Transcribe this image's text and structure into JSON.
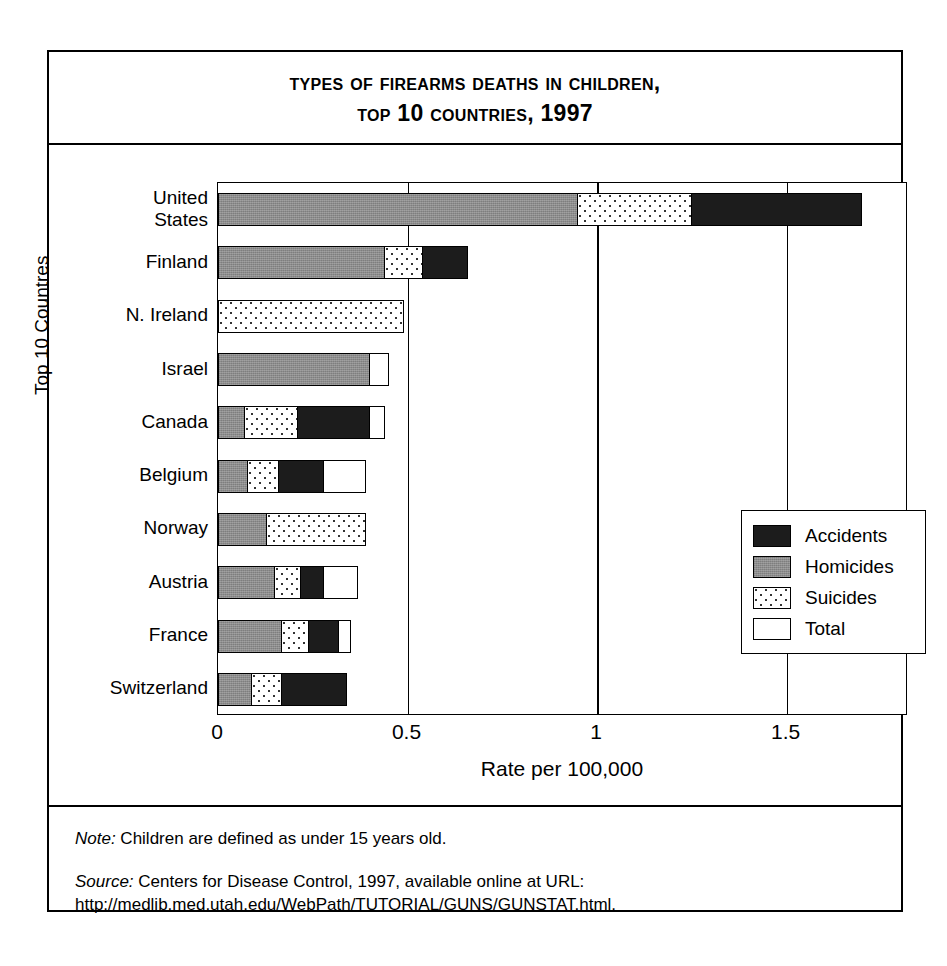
{
  "title": {
    "line1": "Types of Firearms Deaths in Children,",
    "line2": "Top 10 Countries, 1997"
  },
  "notes": {
    "note_label": "Note:",
    "note_text": " Children are defined as under 15 years old.",
    "source_label": "Source:",
    "source_text": " Centers for Disease Control, 1997, available online at URL: http://medlib.med.utah.edu/WebPath/TUTORIAL/GUNS/GUNSTAT.html."
  },
  "legend": {
    "items": [
      {
        "label": "Accidents",
        "swatch": "black-swatch-icon"
      },
      {
        "label": "Homicides",
        "swatch": "gray-swatch-icon"
      },
      {
        "label": "Suicides",
        "swatch": "dotted-swatch-icon"
      },
      {
        "label": "Total",
        "swatch": "white-swatch-icon"
      }
    ]
  },
  "chart_data": {
    "type": "bar",
    "title": "Types of Firearms Deaths in Children, Top 10 Countries, 1997",
    "xlabel": "Rate per 100,000",
    "ylabel": "Top 10 Countres",
    "orientation": "horizontal",
    "stacked": true,
    "grid": true,
    "legend_position": "inside-right",
    "xlim": [
      0,
      1.82
    ],
    "xticks": [
      0,
      0.5,
      1,
      1.5
    ],
    "xticklabels": [
      "0",
      "0.5",
      "1",
      "1.5"
    ],
    "categories": [
      "United\nStates",
      "Finland",
      "N. Ireland",
      "Israel",
      "Canada",
      "Belgium",
      "Norway",
      "Austria",
      "France",
      "Switzerland"
    ],
    "series": [
      {
        "name": "Homicides",
        "color": "#8c8c8c",
        "values": [
          0.95,
          0.44,
          0.0,
          0.4,
          0.07,
          0.08,
          0.13,
          0.15,
          0.17,
          0.09
        ]
      },
      {
        "name": "Suicides",
        "color": "#ffffff",
        "values": [
          0.3,
          0.1,
          0.49,
          0.0,
          0.14,
          0.08,
          0.26,
          0.07,
          0.07,
          0.08
        ]
      },
      {
        "name": "Accidents",
        "color": "#1c1c1c",
        "values": [
          0.45,
          0.12,
          0.0,
          0.0,
          0.19,
          0.12,
          0.0,
          0.06,
          0.08,
          0.17
        ]
      },
      {
        "name": "Total",
        "color": "#ffffff",
        "values": [
          1.68,
          0.63,
          0.49,
          0.45,
          0.44,
          0.39,
          0.39,
          0.37,
          0.35,
          0.33
        ]
      }
    ],
    "rows": [
      {
        "label": "United\nStates",
        "homicides": 0.95,
        "suicides": 0.3,
        "accidents": 0.45,
        "total": 1.68
      },
      {
        "label": "Finland",
        "homicides": 0.44,
        "suicides": 0.1,
        "accidents": 0.12,
        "total": 0.63
      },
      {
        "label": "N. Ireland",
        "homicides": 0.0,
        "suicides": 0.49,
        "accidents": 0.0,
        "total": 0.49
      },
      {
        "label": "Israel",
        "homicides": 0.4,
        "suicides": 0.0,
        "accidents": 0.0,
        "total": 0.45
      },
      {
        "label": "Canada",
        "homicides": 0.07,
        "suicides": 0.14,
        "accidents": 0.19,
        "total": 0.44
      },
      {
        "label": "Belgium",
        "homicides": 0.08,
        "suicides": 0.08,
        "accidents": 0.12,
        "total": 0.39
      },
      {
        "label": "Norway",
        "homicides": 0.13,
        "suicides": 0.26,
        "accidents": 0.0,
        "total": 0.39
      },
      {
        "label": "Austria",
        "homicides": 0.15,
        "suicides": 0.07,
        "accidents": 0.06,
        "total": 0.37
      },
      {
        "label": "France",
        "homicides": 0.17,
        "suicides": 0.07,
        "accidents": 0.08,
        "total": 0.35
      },
      {
        "label": "Switzerland",
        "homicides": 0.09,
        "suicides": 0.08,
        "accidents": 0.17,
        "total": 0.33
      }
    ]
  }
}
